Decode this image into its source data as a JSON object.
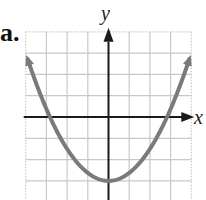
{
  "panel_label": "a.",
  "chart_data": {
    "type": "line",
    "title": "",
    "xlabel": "x",
    "ylabel": "y",
    "function": "y = 0.375x^2 - 3 (approx)",
    "xlim": [
      -4,
      4
    ],
    "ylim": [
      -4,
      4
    ],
    "grid": true,
    "grid_spacing": 1,
    "vertex": [
      0,
      -3
    ],
    "x_intercepts": [
      -2.83,
      2.83
    ],
    "series": [
      {
        "name": "parabola",
        "x": [
          -4.0,
          -3.5,
          -3.0,
          -2.5,
          -2.0,
          -1.5,
          -1.0,
          -0.5,
          0,
          0.5,
          1.0,
          1.5,
          2.0,
          2.5,
          3.0,
          3.5,
          4.0
        ],
        "y": [
          3.0,
          1.59,
          0.38,
          -0.66,
          -1.5,
          -2.16,
          -2.63,
          -2.91,
          -3.0,
          -2.91,
          -2.63,
          -2.16,
          -1.5,
          -0.66,
          0.38,
          1.59,
          3.0
        ]
      }
    ],
    "curve_color": "#7a7a7a",
    "axis_color": "#1a1a1a",
    "grid_color": "#c8c8c8"
  }
}
